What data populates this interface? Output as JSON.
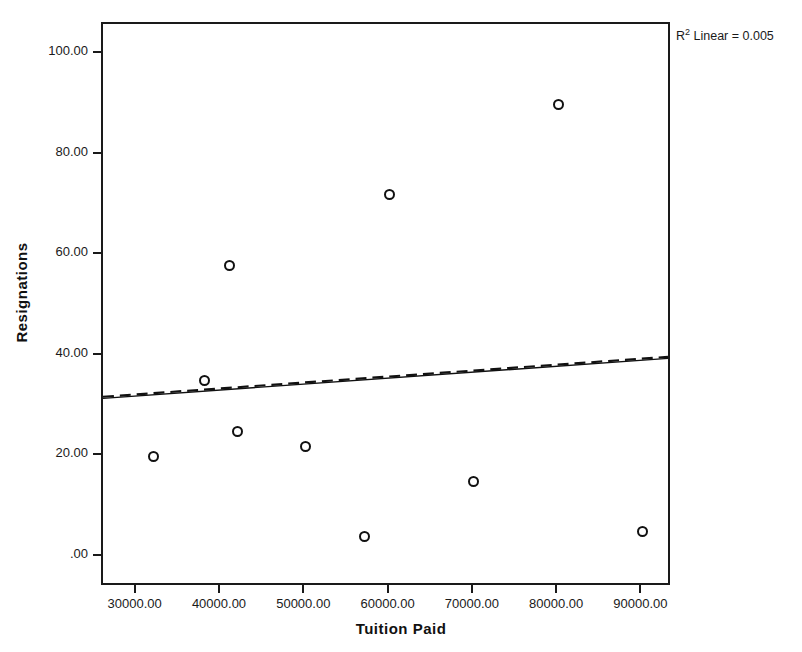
{
  "chart_data": {
    "type": "scatter",
    "title": "",
    "xlabel": "Tuition Paid",
    "ylabel": "Resignations",
    "xlim": [
      26000,
      93500
    ],
    "ylim": [
      -6,
      106
    ],
    "grid": false,
    "legend": false,
    "marker_style": "open-circle",
    "x": [
      32000,
      38000,
      41000,
      42000,
      50000,
      57000,
      60000,
      70000,
      80000,
      90000
    ],
    "y": [
      20,
      35,
      58,
      25,
      22,
      4,
      72,
      15,
      90,
      5
    ],
    "points": [
      {
        "x": 32000,
        "y": 20
      },
      {
        "x": 38000,
        "y": 35
      },
      {
        "x": 41000,
        "y": 58
      },
      {
        "x": 42000,
        "y": 25
      },
      {
        "x": 50000,
        "y": 22
      },
      {
        "x": 57000,
        "y": 4
      },
      {
        "x": 60000,
        "y": 72
      },
      {
        "x": 70000,
        "y": 15
      },
      {
        "x": 80000,
        "y": 90
      },
      {
        "x": 90000,
        "y": 5
      }
    ],
    "xticks": [
      30000,
      40000,
      50000,
      60000,
      70000,
      80000,
      90000
    ],
    "xtick_labels": [
      "30000.00",
      "40000.00",
      "50000.00",
      "60000.00",
      "70000.00",
      "80000.00",
      "90000.00"
    ],
    "yticks": [
      0,
      20,
      40,
      60,
      80,
      100
    ],
    "ytick_labels": [
      ".00",
      "20.00",
      "40.00",
      "60.00",
      "80.00",
      "100.00"
    ],
    "fit_line": {
      "type": "linear",
      "x_start": 26000,
      "y_start": 31.0,
      "x_end": 93500,
      "y_end": 39.0,
      "style": "dashed-over-solid",
      "color": "#111111"
    },
    "annotation": {
      "text_prefix": "R",
      "text_superscript": "2",
      "text_suffix": " Linear = 0.005",
      "full_text": "R2 Linear = 0.005",
      "r_squared": 0.005
    }
  },
  "axes": {
    "x_title": "Tuition Paid",
    "y_title": "Resignations"
  },
  "annotation": {
    "r_label": "R",
    "r_exponent": "2",
    "r_rest": " Linear = 0.005"
  }
}
